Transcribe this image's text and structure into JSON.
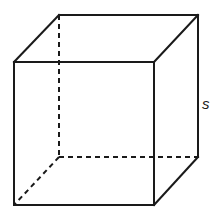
{
  "diagram": {
    "type": "cube",
    "vertices": {
      "front_top_left": [
        14,
        62
      ],
      "front_top_right": [
        154,
        62
      ],
      "front_bottom_left": [
        14,
        205
      ],
      "front_bottom_right": [
        154,
        205
      ],
      "back_top_left": [
        59,
        15
      ],
      "back_top_right": [
        198,
        15
      ],
      "back_bottom_left": [
        59,
        157
      ],
      "back_bottom_right": [
        198,
        157
      ]
    },
    "hidden_edges": [
      "back_top_left-back_bottom_left",
      "back_bottom_left-back_bottom_right",
      "back_bottom_left-front_bottom_left"
    ],
    "side_label": "s",
    "line_color": "#1a1a1a"
  }
}
